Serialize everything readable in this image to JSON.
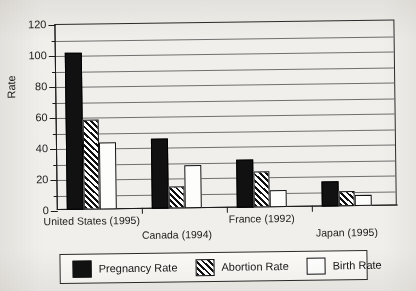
{
  "chart_data": {
    "type": "bar",
    "title": "",
    "xlabel": "",
    "ylabel": "Rate",
    "ylim": [
      0,
      120
    ],
    "ytick_step": 20,
    "gridline_step": 10,
    "grid": true,
    "legend_position": "bottom",
    "categories": [
      "United States (1995)",
      "Canada (1994)",
      "France (1992)",
      "Japan (1995)"
    ],
    "ytick_labels": [
      "0",
      "20",
      "40",
      "60",
      "80",
      "100",
      "120"
    ],
    "series": [
      {
        "name": "Pregnancy Rate",
        "fill": "solid-black",
        "values": [
          101,
          45,
          31,
          16
        ]
      },
      {
        "name": "Abortion Rate",
        "fill": "diagonal-hatch",
        "values": [
          58,
          14,
          23,
          10
        ]
      },
      {
        "name": "Birth Rate",
        "fill": "white",
        "values": [
          43,
          28,
          11,
          7
        ]
      }
    ]
  },
  "colors": {
    "page_background": "#f1efeb",
    "ink": "#111111",
    "gridline": "#6f6f6f",
    "legend_background": "#fbfaf7"
  },
  "legend": {
    "items": [
      {
        "label": "Pregnancy Rate"
      },
      {
        "label": "Abortion Rate"
      },
      {
        "label": "Birth Rate"
      }
    ]
  }
}
